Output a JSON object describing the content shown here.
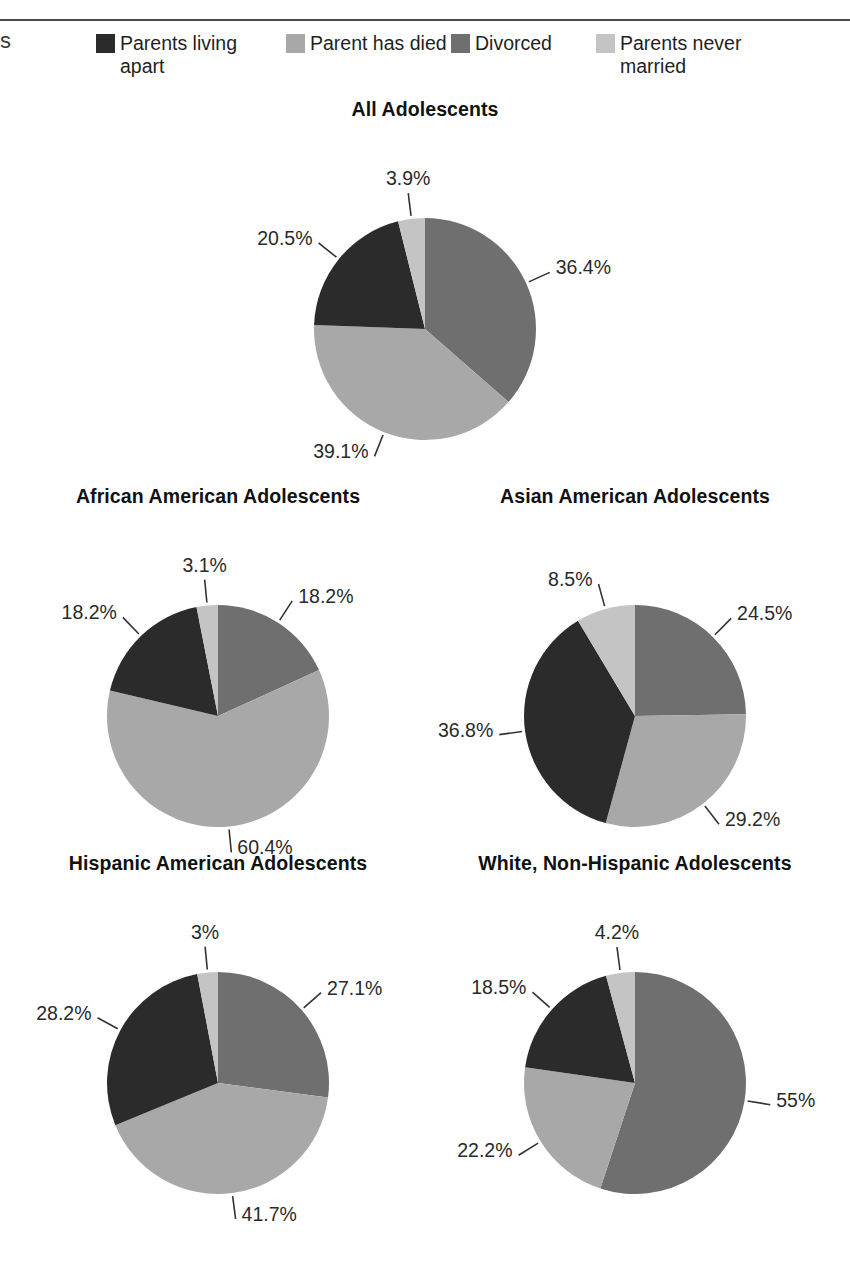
{
  "page": {
    "edge_fragment": "s",
    "divider": "horizontal-rule"
  },
  "legend": {
    "items": [
      {
        "label": "Parents living apart",
        "color": "#2b2b2b"
      },
      {
        "label": "Parent has died",
        "color": "#a8a8a8"
      },
      {
        "label": "Divorced",
        "color": "#6f6f6f"
      },
      {
        "label": "Parents never married",
        "color": "#c4c4c4"
      }
    ]
  },
  "chart_data": [
    {
      "type": "pie",
      "title": "All Adolescents",
      "categories": [
        "Divorced",
        "Parent has died",
        "Parents living apart",
        "Parents never married"
      ],
      "values": [
        36.4,
        39.1,
        20.5,
        3.9
      ],
      "labels": [
        "36.4%",
        "39.1%",
        "20.5%",
        "3.9%"
      ],
      "colors": [
        "#6f6f6f",
        "#a8a8a8",
        "#2b2b2b",
        "#c4c4c4"
      ],
      "start_angle": 0,
      "legend_position": "top"
    },
    {
      "type": "pie",
      "title": "African American Adolescents",
      "categories": [
        "Divorced",
        "Parent has died",
        "Parents living apart",
        "Parents never married"
      ],
      "values": [
        18.2,
        60.4,
        18.2,
        3.1
      ],
      "labels": [
        "18.2%",
        "60.4%",
        "18.2%",
        "3.1%"
      ],
      "colors": [
        "#6f6f6f",
        "#a8a8a8",
        "#2b2b2b",
        "#c4c4c4"
      ],
      "start_angle": 0,
      "legend_position": "top"
    },
    {
      "type": "pie",
      "title": "Asian American Adolescents",
      "categories": [
        "Divorced",
        "Parent has died",
        "Parents living apart",
        "Parents never married"
      ],
      "values": [
        24.5,
        29.2,
        36.8,
        8.5
      ],
      "labels": [
        "24.5%",
        "29.2%",
        "36.8%",
        "8.5%"
      ],
      "colors": [
        "#6f6f6f",
        "#a8a8a8",
        "#2b2b2b",
        "#c4c4c4"
      ],
      "start_angle": 0,
      "legend_position": "top"
    },
    {
      "type": "pie",
      "title": "Hispanic American Adolescents",
      "categories": [
        "Divorced",
        "Parent has died",
        "Parents living apart",
        "Parents never married"
      ],
      "values": [
        27.1,
        41.7,
        28.2,
        3.0
      ],
      "labels": [
        "27.1%",
        "41.7%",
        "28.2%",
        "3%"
      ],
      "colors": [
        "#6f6f6f",
        "#a8a8a8",
        "#2b2b2b",
        "#c4c4c4"
      ],
      "start_angle": 0,
      "legend_position": "top"
    },
    {
      "type": "pie",
      "title": "White, Non-Hispanic Adolescents",
      "categories": [
        "Divorced",
        "Parent has died",
        "Parents living apart",
        "Parents never married"
      ],
      "values": [
        55.0,
        22.2,
        18.5,
        4.2
      ],
      "labels": [
        "55%",
        "22.2%",
        "18.5%",
        "4.2%"
      ],
      "colors": [
        "#6f6f6f",
        "#a8a8a8",
        "#2b2b2b",
        "#c4c4c4"
      ],
      "start_angle": 0,
      "legend_position": "top"
    }
  ]
}
